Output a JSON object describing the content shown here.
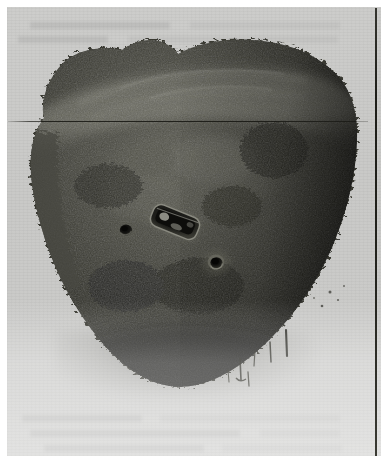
{
  "image": {
    "kind": "photographic-plate",
    "subject": "corroded-metal-artifact",
    "orientation": "upright",
    "alt_text": "Black and white photograph of a dark, heavily corroded rounded metal object with two circular perforations and a central elongated slot, resting on a plain light grey background.",
    "caption": ""
  },
  "page": {
    "background_color": "#ffffff",
    "plate_background_color": "#c8c8c6",
    "margin_color": "#ffffff"
  },
  "marks": {
    "vertical_rule": {
      "name": "right-edge-rule",
      "color": "#1f1f1a",
      "x": 375,
      "y": 8,
      "width": 2,
      "height": 448
    },
    "horizontal_rule": {
      "name": "upper-hairline",
      "color": "#191914",
      "x": 8,
      "y": 121,
      "width": 360,
      "height": 1
    }
  },
  "artifact": {
    "name": "perforated-corroded-disc",
    "fill_color": "#3a3a35",
    "dark_color": "#1c1c18",
    "highlight_color": "#8d8d86",
    "bounds": {
      "x": 18,
      "y": 36,
      "width": 340,
      "height": 352
    },
    "features": [
      {
        "name": "hole-left",
        "type": "circular-perforation",
        "cx": 126,
        "cy": 230,
        "r": 6
      },
      {
        "name": "hole-right",
        "type": "circular-perforation",
        "cx": 216,
        "cy": 262,
        "r": 8
      },
      {
        "name": "central-slot",
        "type": "rectangular-slot",
        "cx": 175,
        "cy": 222,
        "width": 52,
        "height": 26,
        "rotation_deg": 22
      },
      {
        "name": "upper-ridge-band",
        "type": "raised-band",
        "description": "broad lighter horizontal band across the upper third of the object"
      },
      {
        "name": "encrustation-left-edge",
        "type": "corrosion-crust",
        "description": "rough, flaking accretion along the left flank"
      },
      {
        "name": "encrustation-right-edge",
        "type": "corrosion-crust",
        "description": "dense dark accretion along the right flank"
      },
      {
        "name": "drip-marks-lower-right",
        "type": "surface-streaks",
        "description": "thin dark vertical streaks on the paper below the lower right edge"
      }
    ]
  },
  "ghost_text_rows": [
    {
      "x": 30,
      "y": 22,
      "width": 140
    },
    {
      "x": 190,
      "y": 22,
      "width": 150
    },
    {
      "x": 18,
      "y": 36,
      "width": 90
    },
    {
      "x": 128,
      "y": 36,
      "width": 210
    },
    {
      "x": 22,
      "y": 415,
      "width": 120
    },
    {
      "x": 160,
      "y": 415,
      "width": 180
    },
    {
      "x": 30,
      "y": 430,
      "width": 210
    },
    {
      "x": 260,
      "y": 430,
      "width": 80
    },
    {
      "x": 44,
      "y": 445,
      "width": 160
    },
    {
      "x": 222,
      "y": 445,
      "width": 120
    }
  ]
}
